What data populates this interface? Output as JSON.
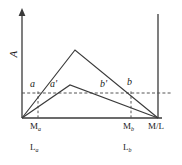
{
  "figure": {
    "type": "line-diagram",
    "axes": {
      "y_label": "A",
      "y_label_rotated": true,
      "x_right_label": "M/L",
      "axis_color": "#3a3a3a",
      "origin": [
        22,
        118
      ],
      "x_end": 158,
      "y_top": 10
    },
    "guides": {
      "horizontal_dashed_y": 93,
      "dashed_color": "#555555",
      "vertical_dashed_x": [
        38,
        131
      ]
    },
    "curves": [
      {
        "name": "tall-curve",
        "points": [
          [
            22,
            118
          ],
          [
            75,
            50
          ],
          [
            158,
            118
          ]
        ],
        "color": "#3a3a3a"
      },
      {
        "name": "low-curve",
        "points": [
          [
            22,
            118
          ],
          [
            70,
            85
          ],
          [
            158,
            118
          ]
        ],
        "color": "#3a3a3a"
      }
    ],
    "point_labels": [
      {
        "id": "a",
        "text": "a",
        "x": 30,
        "y": 80
      },
      {
        "id": "a'",
        "text": "a'",
        "x": 50,
        "y": 80
      },
      {
        "id": "b'",
        "text": "b'",
        "x": 100,
        "y": 80
      },
      {
        "id": "b",
        "text": "b",
        "x": 127,
        "y": 78
      }
    ],
    "axis_ticks": [
      {
        "id": "Ma",
        "base": "M",
        "sub": "a",
        "x": 30,
        "y": 122
      },
      {
        "id": "Mb",
        "base": "M",
        "sub": "b",
        "x": 123,
        "y": 122
      },
      {
        "id": "MoverL",
        "base": "M/L",
        "sub": "",
        "x": 148,
        "y": 122
      }
    ],
    "lower_labels": [
      {
        "id": "La",
        "base": "L",
        "sub": "a",
        "x": 30,
        "y": 144
      },
      {
        "id": "Lb",
        "base": "L",
        "sub": "b",
        "x": 123,
        "y": 144
      }
    ]
  }
}
